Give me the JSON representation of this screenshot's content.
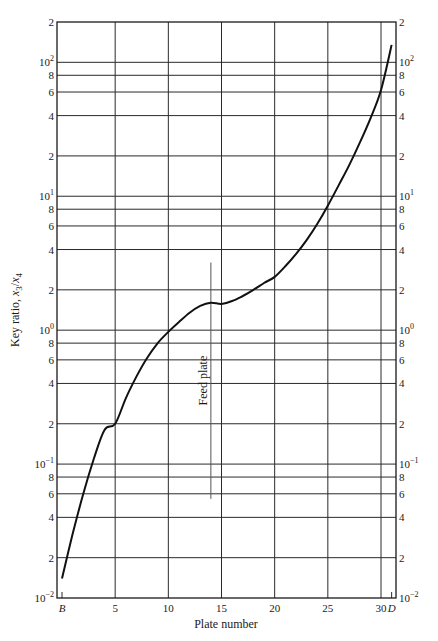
{
  "chart_data": {
    "type": "line",
    "title": "",
    "xlabel": "Plate number",
    "ylabel": "Key ratio, x3/x4",
    "ylabel_parts": {
      "main": "Key ratio, ",
      "var1": "x",
      "sub1": "3",
      "slash": "/",
      "var2": "x",
      "sub2": "4"
    },
    "yscale": "log",
    "xlim": [
      0,
      31
    ],
    "ylim": [
      0.01,
      200
    ],
    "grid": true,
    "x_ticks": [
      {
        "value": 0,
        "label": "B"
      },
      {
        "value": 5,
        "label": "5"
      },
      {
        "value": 10,
        "label": "10"
      },
      {
        "value": 15,
        "label": "15"
      },
      {
        "value": 20,
        "label": "20"
      },
      {
        "value": 25,
        "label": "25"
      },
      {
        "value": 30,
        "label": "30"
      },
      {
        "value": 31,
        "label": "D"
      }
    ],
    "y_ticks": [
      {
        "value": 0.01,
        "base": "10",
        "exp": "−2",
        "label": ""
      },
      {
        "value": 0.02,
        "label": "2"
      },
      {
        "value": 0.04,
        "label": "4"
      },
      {
        "value": 0.06,
        "label": "6"
      },
      {
        "value": 0.08,
        "label": "8"
      },
      {
        "value": 0.1,
        "base": "10",
        "exp": "−1",
        "label": ""
      },
      {
        "value": 0.2,
        "label": "2"
      },
      {
        "value": 0.4,
        "label": "4"
      },
      {
        "value": 0.6,
        "label": "6"
      },
      {
        "value": 0.8,
        "label": "8"
      },
      {
        "value": 1,
        "base": "10",
        "exp": "0",
        "label": ""
      },
      {
        "value": 2,
        "label": "2"
      },
      {
        "value": 4,
        "label": "4"
      },
      {
        "value": 6,
        "label": "6"
      },
      {
        "value": 8,
        "label": "8"
      },
      {
        "value": 10,
        "base": "10",
        "exp": "1",
        "label": ""
      },
      {
        "value": 20,
        "label": "2"
      },
      {
        "value": 40,
        "label": "4"
      },
      {
        "value": 60,
        "label": "6"
      },
      {
        "value": 80,
        "label": "8"
      },
      {
        "value": 100,
        "base": "10",
        "exp": "2",
        "label": ""
      },
      {
        "value": 200,
        "label": "2"
      }
    ],
    "series": [
      {
        "name": "Key ratio",
        "x": [
          0,
          1,
          2,
          3,
          4,
          5,
          6,
          7,
          8,
          9,
          10,
          11,
          12,
          13,
          14,
          15,
          16,
          17,
          18,
          19,
          20,
          21,
          22,
          23,
          24,
          25,
          26,
          27,
          28,
          29,
          30,
          31
        ],
        "y": [
          0.014,
          0.03,
          0.06,
          0.11,
          0.18,
          0.2,
          0.31,
          0.45,
          0.62,
          0.8,
          0.97,
          1.15,
          1.35,
          1.52,
          1.6,
          1.57,
          1.65,
          1.8,
          2.0,
          2.25,
          2.5,
          3.0,
          3.7,
          4.7,
          6.2,
          8.5,
          12,
          17,
          25,
          38,
          62,
          135
        ]
      }
    ],
    "annotations": [
      {
        "text": "Feed plate",
        "x": 14,
        "y_range": [
          0.055,
          3.2
        ],
        "orientation": "vertical"
      }
    ]
  }
}
